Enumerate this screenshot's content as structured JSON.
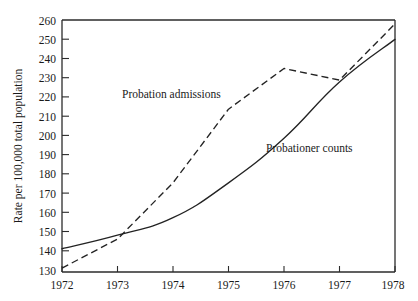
{
  "chart_data": {
    "type": "line",
    "title": "",
    "subtitle": "",
    "xlabel": "",
    "ylabel": "Rate per 100,000 total population",
    "x": [
      1972,
      1973,
      1974,
      1975,
      1976,
      1977,
      1978
    ],
    "xtick_labels": [
      "1972",
      "1973",
      "1974",
      "1975",
      "1976",
      "1977",
      "1978"
    ],
    "xlim": [
      1972,
      1978
    ],
    "ylim": [
      130,
      260
    ],
    "ytick_labels": [
      "130",
      "140",
      "150",
      "160",
      "170",
      "180",
      "190",
      "200",
      "210",
      "220",
      "230",
      "240",
      "250",
      "260"
    ],
    "ytick_values": [
      130,
      140,
      150,
      160,
      170,
      180,
      190,
      200,
      210,
      220,
      230,
      240,
      250,
      260
    ],
    "grid": false,
    "legend_position": "inline-annotations",
    "series": [
      {
        "name": "Probation admissions",
        "style": "dashed",
        "color": "#232323",
        "values": [
          132,
          147,
          176,
          214,
          235,
          229,
          258
        ]
      },
      {
        "name": "Probationer counts",
        "style": "solid",
        "color": "#232323",
        "values": [
          142,
          149,
          158,
          176,
          199,
          228,
          250
        ]
      }
    ],
    "annotations": [
      {
        "text": "Probation admissions",
        "x_px": 122,
        "y_px": 98
      },
      {
        "text": "Probationer counts",
        "x_px": 266,
        "y_px": 152
      }
    ]
  },
  "axes": {
    "y_axis_title": "Rate per 100,000 total population",
    "y_ticks": [
      {
        "label": "260",
        "value": 260
      },
      {
        "label": "250",
        "value": 250
      },
      {
        "label": "240",
        "value": 240
      },
      {
        "label": "230",
        "value": 230
      },
      {
        "label": "220",
        "value": 220
      },
      {
        "label": "210",
        "value": 210
      },
      {
        "label": "200",
        "value": 200
      },
      {
        "label": "190",
        "value": 190
      },
      {
        "label": "180",
        "value": 180
      },
      {
        "label": "170",
        "value": 170
      },
      {
        "label": "160",
        "value": 160
      },
      {
        "label": "150",
        "value": 150
      },
      {
        "label": "140",
        "value": 140
      },
      {
        "label": "130",
        "value": 130
      }
    ],
    "x_ticks": [
      {
        "label": "1972",
        "value": 1972
      },
      {
        "label": "1973",
        "value": 1973
      },
      {
        "label": "1974",
        "value": 1974
      },
      {
        "label": "1975",
        "value": 1975
      },
      {
        "label": "1976",
        "value": 1976
      },
      {
        "label": "1977",
        "value": 1977
      },
      {
        "label": "1978",
        "value": 1978
      }
    ]
  }
}
